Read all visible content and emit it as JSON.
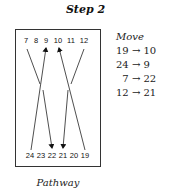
{
  "title": "Step 2",
  "diagram": {
    "top_labels": [
      "7",
      "8",
      "9",
      "10",
      "11",
      "12"
    ],
    "bottom_labels": [
      "24",
      "23",
      "22",
      "21",
      "20",
      "19"
    ],
    "paths": [
      {
        "from": "7",
        "to": "22"
      },
      {
        "from": "24",
        "to": "9"
      },
      {
        "from": "19",
        "to": "10"
      },
      {
        "from": "12",
        "to": "21"
      }
    ]
  },
  "moves": {
    "heading": "Move",
    "rows": [
      "19 → 10",
      "24 → 9",
      "  7 → 22",
      "12 → 21"
    ]
  },
  "caption": "Pathway"
}
